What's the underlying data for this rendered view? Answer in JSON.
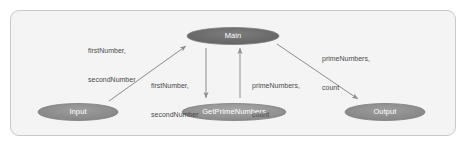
{
  "diagram": {
    "type": "structure-chart",
    "frame": {
      "border_color": "#c9c9c9",
      "background_color": "#f4f4f4"
    },
    "nodes": [
      {
        "id": "main",
        "label": "Main",
        "cx": 233,
        "cy": 36,
        "rx": 46,
        "ry": 8.5,
        "fill": "#6f6f6f"
      },
      {
        "id": "input",
        "label": "Input",
        "cx": 78,
        "cy": 112,
        "rx": 40,
        "ry": 8.5,
        "fill": "#8f8f8f"
      },
      {
        "id": "gpn",
        "label": "GetPrimeNumbers",
        "cx": 234,
        "cy": 112,
        "rx": 52,
        "ry": 8.5,
        "fill": "#949494"
      },
      {
        "id": "output",
        "label": "Output",
        "cx": 385,
        "cy": 112,
        "rx": 40,
        "ry": 8.5,
        "fill": "#8f8f8f"
      }
    ],
    "edges": [
      {
        "id": "input-to-main",
        "from": "input",
        "to": "main",
        "direction": "up-right",
        "label": "firstNumber,\nsecondNumber"
      },
      {
        "id": "main-to-gpn",
        "from": "main",
        "to": "gpn",
        "direction": "down",
        "label": "firstNumber,\nsecondNumber"
      },
      {
        "id": "gpn-to-main",
        "from": "gpn",
        "to": "main",
        "direction": "up",
        "label": "primeNumbers,\ncount"
      },
      {
        "id": "main-to-output",
        "from": "main",
        "to": "output",
        "direction": "down-right",
        "label": "primeNumbers,\ncount"
      }
    ],
    "labels": {
      "input_to_main": {
        "line1": "firstNumber,",
        "line2": "secondNumber",
        "x": 88,
        "y": 30
      },
      "main_to_gpn": {
        "line1": "firstNumber,",
        "line2": "secondNumber",
        "x": 150,
        "y": 64
      },
      "gpn_to_main": {
        "line1": "primeNumbers,",
        "line2": "count",
        "x": 253,
        "y": 64
      },
      "main_to_output": {
        "line1": "primeNumbers,",
        "line2": "count",
        "x": 322,
        "y": 38
      }
    },
    "colors": {
      "edge_stroke": "#8c8c8c",
      "node_stroke": "#7b7b7b",
      "node_text": "#ffffff",
      "edge_text": "#4a4a4a"
    }
  }
}
